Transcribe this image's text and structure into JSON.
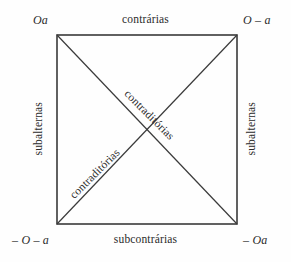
{
  "diagram": {
    "colors": {
      "background": "#fefefe",
      "line": "#3a3a3a",
      "text": "#2b2b2b"
    },
    "geometry": {
      "left": 57,
      "top": 35,
      "right": 237,
      "bottom": 224
    },
    "corners": {
      "top_left": "Oa",
      "top_right": "O – a",
      "bottom_left": "– O – a",
      "bottom_right": "– Oa"
    },
    "edges": {
      "top": "contrárias",
      "bottom": "subcontrárias",
      "left": "subalternas",
      "right": "subalternas"
    },
    "diagonals": {
      "upper": "contraditórias",
      "lower": "contraditórias"
    }
  }
}
